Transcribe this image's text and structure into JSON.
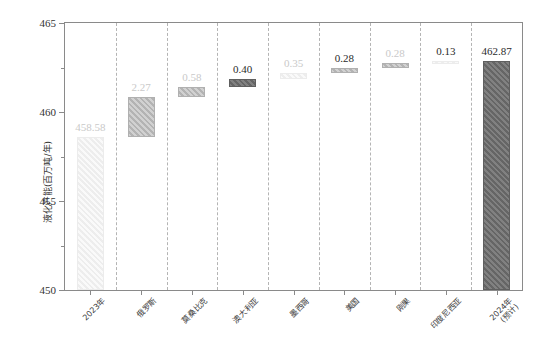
{
  "chart_data": {
    "type": "bar",
    "subtype": "waterfall",
    "title": "",
    "xlabel": "",
    "ylabel": "液化产能(百万吨/年)",
    "ylim": [
      450,
      465
    ],
    "yticks": [
      450,
      455,
      460,
      465
    ],
    "ytick_labels": [
      "450",
      "455",
      "460",
      "465"
    ],
    "grid": false,
    "legend": "none",
    "categories": [
      "2023年",
      "俄罗斯",
      "莫桑比克",
      "澳大利亚",
      "墨西哥",
      "美国",
      "刚果",
      "印度尼西亚",
      "2024年\n(预计)"
    ],
    "category_lines": [
      [
        "2023年"
      ],
      [
        "俄罗斯"
      ],
      [
        "莫桑比克"
      ],
      [
        "澳大利亚"
      ],
      [
        "墨西哥"
      ],
      [
        "美国"
      ],
      [
        "刚果"
      ],
      [
        "印度尼西亚"
      ],
      [
        "2024年",
        "(预计)"
      ]
    ],
    "values": [
      458.58,
      2.27,
      0.58,
      0.4,
      0.35,
      0.28,
      0.28,
      0.13,
      462.87
    ],
    "value_labels": [
      "458.58",
      "2.27",
      "0.58",
      "0.40",
      "0.35",
      "0.28",
      "0.28",
      "0.13",
      "462.87"
    ],
    "bar_bases": [
      450.0,
      458.58,
      460.85,
      461.43,
      461.83,
      462.18,
      462.46,
      462.74,
      450.0
    ],
    "bar_tops": [
      458.58,
      460.85,
      461.43,
      461.83,
      462.18,
      462.46,
      462.74,
      462.87,
      462.87
    ],
    "bar_kinds": [
      "total",
      "increase",
      "increase",
      "increase",
      "increase",
      "increase",
      "increase",
      "increase",
      "total"
    ],
    "bar_styles": [
      "pale",
      "mid",
      "mid",
      "dark",
      "pale",
      "mid",
      "mid",
      "pale",
      "dark"
    ],
    "label_styles": [
      "faint",
      "faint",
      "faint",
      "strong",
      "faint",
      "strong",
      "faint",
      "strong",
      "strong"
    ],
    "colors": {
      "pale": "#f2f2f2",
      "light": "#e8e8e8",
      "mid": "#bdbdbd",
      "dark": "#6e6e6e",
      "axis": "#8a8a8a",
      "separator": "#b4b4b4",
      "text_strong": "#2b2b2b",
      "text_faint": "#c9c9c9"
    }
  }
}
